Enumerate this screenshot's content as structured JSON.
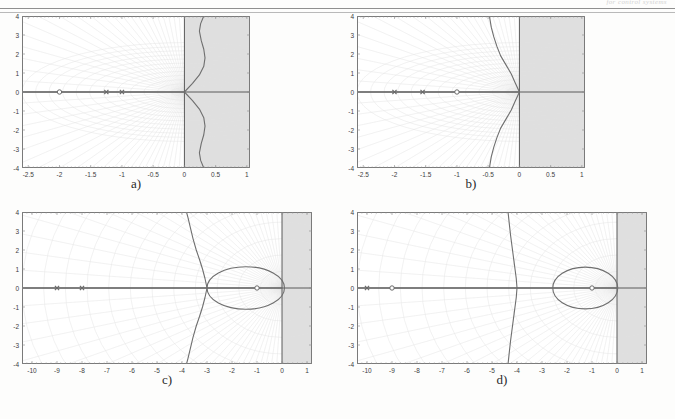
{
  "page": {
    "header_text": "for control systems",
    "background": "#fdfdfc",
    "shade_color": "#d9d9d9",
    "axis_color": "#5a5a5a",
    "locus_color": "#6f6f6f",
    "grid_color": "#e2e2e2",
    "frame_color": "#7a7a7a"
  },
  "panels": [
    {
      "id": "a",
      "caption": "a)",
      "chart_data": {
        "type": "line",
        "title": "a)",
        "xlabel": "",
        "ylabel": "",
        "xlim": [
          -2.6,
          1.05
        ],
        "ylim": [
          -4,
          4
        ],
        "xticks": [
          "-2.5",
          "-2",
          "-1.5",
          "-1",
          "-0.5",
          "0",
          "0.5",
          "1"
        ],
        "xtick_values": [
          -2.5,
          -2,
          -1.5,
          -1,
          -0.5,
          0,
          0.5,
          1
        ],
        "yticks": [
          "4",
          "3",
          "2",
          "1",
          "0",
          "-1",
          "-2",
          "-3",
          "-4"
        ],
        "ytick_values": [
          4,
          3,
          2,
          1,
          0,
          -1,
          -2,
          -3,
          -4
        ],
        "grid": true,
        "legend": "none",
        "shaded_region": {
          "label": "unstable-half-plane",
          "x_from": 0,
          "x_to": 1.05
        },
        "poles": [
          [
            -1.25,
            0
          ],
          [
            -1.0,
            0
          ]
        ],
        "zeros": [
          [
            -2.0,
            0
          ]
        ],
        "real_axis_segments": [
          [
            -2.6,
            0
          ]
        ],
        "branches": [
          {
            "name": "upper-branch",
            "points": [
              [
                0,
                0
              ],
              [
                0.13,
                0.45
              ],
              [
                0.24,
                0.9
              ],
              [
                0.31,
                1.35
              ],
              [
                0.33,
                1.8
              ],
              [
                0.31,
                2.25
              ],
              [
                0.27,
                2.7
              ],
              [
                0.24,
                3.2
              ],
              [
                0.26,
                3.6
              ],
              [
                0.31,
                4.0
              ]
            ]
          },
          {
            "name": "lower-branch",
            "points": [
              [
                0,
                0
              ],
              [
                0.13,
                -0.45
              ],
              [
                0.24,
                -0.9
              ],
              [
                0.31,
                -1.35
              ],
              [
                0.33,
                -1.8
              ],
              [
                0.31,
                -2.25
              ],
              [
                0.27,
                -2.7
              ],
              [
                0.24,
                -3.2
              ],
              [
                0.26,
                -3.6
              ],
              [
                0.31,
                -4.0
              ]
            ]
          }
        ]
      }
    },
    {
      "id": "b",
      "caption": "b)",
      "chart_data": {
        "type": "line",
        "title": "b)",
        "xlabel": "",
        "ylabel": "",
        "xlim": [
          -2.6,
          1.05
        ],
        "ylim": [
          -4,
          4
        ],
        "xticks": [
          "-2.5",
          "-2",
          "-1.5",
          "-1",
          "-0.5",
          "0",
          "0.5",
          "1"
        ],
        "xtick_values": [
          -2.5,
          -2,
          -1.5,
          -1,
          -0.5,
          0,
          0.5,
          1
        ],
        "yticks": [
          "4",
          "3",
          "2",
          "1",
          "0",
          "-1",
          "-2",
          "-3",
          "-4"
        ],
        "ytick_values": [
          4,
          3,
          2,
          1,
          0,
          -1,
          -2,
          -3,
          -4
        ],
        "grid": true,
        "legend": "none",
        "shaded_region": {
          "label": "unstable-half-plane",
          "x_from": 0,
          "x_to": 1.05
        },
        "poles": [
          [
            -2.0,
            0
          ],
          [
            -1.55,
            0
          ]
        ],
        "zeros": [
          [
            -1.0,
            0
          ]
        ],
        "real_axis_segments": [
          [
            -2.6,
            0
          ]
        ],
        "branches": [
          {
            "name": "upper-branch",
            "points": [
              [
                0,
                0
              ],
              [
                -0.07,
                0.5
              ],
              [
                -0.13,
                0.95
              ],
              [
                -0.21,
                1.4
              ],
              [
                -0.3,
                1.9
              ],
              [
                -0.36,
                2.4
              ],
              [
                -0.41,
                2.9
              ],
              [
                -0.45,
                3.4
              ],
              [
                -0.47,
                3.8
              ],
              [
                -0.48,
                4.0
              ]
            ]
          },
          {
            "name": "lower-branch",
            "points": [
              [
                0,
                0
              ],
              [
                -0.07,
                -0.5
              ],
              [
                -0.13,
                -0.95
              ],
              [
                -0.21,
                -1.4
              ],
              [
                -0.3,
                -1.9
              ],
              [
                -0.36,
                -2.4
              ],
              [
                -0.41,
                -2.9
              ],
              [
                -0.45,
                -3.4
              ],
              [
                -0.47,
                -3.8
              ],
              [
                -0.48,
                -4.0
              ]
            ]
          }
        ]
      }
    },
    {
      "id": "c",
      "caption": "c)",
      "chart_data": {
        "type": "line",
        "title": "c)",
        "xlabel": "",
        "ylabel": "",
        "xlim": [
          -10.4,
          1.2
        ],
        "ylim": [
          -4,
          4
        ],
        "xticks": [
          "-10",
          "-9",
          "-8",
          "-7",
          "-6",
          "-5",
          "-4",
          "-3",
          "-2",
          "-1",
          "0",
          "1"
        ],
        "xtick_values": [
          -10,
          -9,
          -8,
          -7,
          -6,
          -5,
          -4,
          -3,
          -2,
          -1,
          0,
          1
        ],
        "yticks": [
          "4",
          "3",
          "2",
          "1",
          "0",
          "-1",
          "-2",
          "-3",
          "-4"
        ],
        "ytick_values": [
          4,
          3,
          2,
          1,
          0,
          -1,
          -2,
          -3,
          -4
        ],
        "grid": true,
        "legend": "none",
        "shaded_region": {
          "label": "unstable-half-plane",
          "x_from": 0,
          "x_to": 1.2
        },
        "poles": [
          [
            -9.0,
            0
          ],
          [
            -8.0,
            0
          ]
        ],
        "zeros": [
          [
            -1.0,
            0
          ]
        ],
        "real_axis_segments": [
          [
            -10.4,
            0
          ]
        ],
        "branches": [
          {
            "name": "asymptote-upper",
            "points": [
              [
                -3.0,
                0
              ],
              [
                -3.08,
                0.5
              ],
              [
                -3.18,
                1.0
              ],
              [
                -3.3,
                1.5
              ],
              [
                -3.43,
                2.0
              ],
              [
                -3.56,
                2.6
              ],
              [
                -3.67,
                3.2
              ],
              [
                -3.76,
                3.7
              ],
              [
                -3.82,
                4.0
              ]
            ]
          },
          {
            "name": "asymptote-lower",
            "points": [
              [
                -3.0,
                0
              ],
              [
                -3.08,
                -0.5
              ],
              [
                -3.18,
                -1.0
              ],
              [
                -3.3,
                -1.5
              ],
              [
                -3.43,
                -2.0
              ],
              [
                -3.56,
                -2.6
              ],
              [
                -3.67,
                -3.2
              ],
              [
                -3.76,
                -3.7
              ],
              [
                -3.82,
                -4.0
              ]
            ]
          },
          {
            "name": "loop",
            "shape": "oval",
            "center": [
              -1.45,
              0
            ],
            "rx": 1.55,
            "ry": 1.12,
            "breakaway": [
              -3.0,
              0
            ],
            "break_in": [
              0.07,
              0
            ]
          }
        ]
      }
    },
    {
      "id": "d",
      "caption": "d)",
      "chart_data": {
        "type": "line",
        "title": "d)",
        "xlabel": "",
        "ylabel": "",
        "xlim": [
          -10.4,
          1.2
        ],
        "ylim": [
          -4,
          4
        ],
        "xticks": [
          "-10",
          "-9",
          "-8",
          "-7",
          "-6",
          "-5",
          "-4",
          "-3",
          "-2",
          "-1",
          "0",
          "1"
        ],
        "xtick_values": [
          -10,
          -9,
          -8,
          -7,
          -6,
          -5,
          -4,
          -3,
          -2,
          -1,
          0,
          1
        ],
        "yticks": [
          "4",
          "3",
          "2",
          "1",
          "0",
          "-1",
          "-2",
          "-3",
          "-4"
        ],
        "ytick_values": [
          4,
          3,
          2,
          1,
          0,
          -1,
          -2,
          -3,
          -4
        ],
        "grid": true,
        "legend": "none",
        "shaded_region": {
          "label": "unstable-half-plane",
          "x_from": 0,
          "x_to": 1.2
        },
        "poles": [
          [
            -10.0,
            0
          ]
        ],
        "zeros": [
          [
            -9.0,
            0
          ],
          [
            -1.0,
            0
          ]
        ],
        "real_axis_segments": [
          [
            -10.4,
            0
          ]
        ],
        "branches": [
          {
            "name": "asymptote-upper",
            "points": [
              [
                -4.0,
                0
              ],
              [
                -4.03,
                0.5
              ],
              [
                -4.08,
                1.0
              ],
              [
                -4.14,
                1.6
              ],
              [
                -4.2,
                2.2
              ],
              [
                -4.26,
                2.8
              ],
              [
                -4.31,
                3.4
              ],
              [
                -4.35,
                3.9
              ],
              [
                -4.36,
                4.0
              ]
            ]
          },
          {
            "name": "asymptote-lower",
            "points": [
              [
                -4.0,
                0
              ],
              [
                -4.03,
                -0.5
              ],
              [
                -4.08,
                -1.0
              ],
              [
                -4.14,
                -1.6
              ],
              [
                -4.2,
                -2.2
              ],
              [
                -4.26,
                -2.8
              ],
              [
                -4.31,
                -3.4
              ],
              [
                -4.35,
                -3.9
              ],
              [
                -4.36,
                -4.0
              ]
            ]
          },
          {
            "name": "loop",
            "shape": "oval",
            "center": [
              -1.27,
              0
            ],
            "rx": 1.3,
            "ry": 1.1,
            "breakaway": [
              -2.57,
              0
            ],
            "break_in": [
              0.03,
              0
            ]
          }
        ]
      }
    }
  ]
}
